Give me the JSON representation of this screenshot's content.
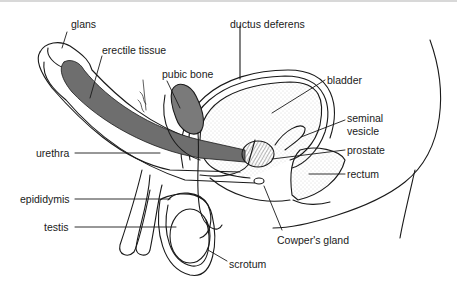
{
  "diagram": {
    "colors": {
      "line": "#1a1a1a",
      "erectile_fill": "#6e6e6e",
      "bone_fill": "#7a7a7a",
      "stipple": "#bdbdbd",
      "background": "#ffffff"
    },
    "labels": {
      "glans": "glans",
      "erectile_tissue": "erectile tissue",
      "pubic_bone": "pubic bone",
      "ductus_deferens": "ductus deferens",
      "bladder": "bladder",
      "seminal_vesicle_1": "seminal",
      "seminal_vesicle_2": "vesicle",
      "prostate": "prostate",
      "rectum": "rectum",
      "urethra": "urethra",
      "epididymis": "epididymis",
      "testis": "testis",
      "cowpers_gland": "Cowper's gland",
      "scrotum": "scrotum"
    }
  }
}
